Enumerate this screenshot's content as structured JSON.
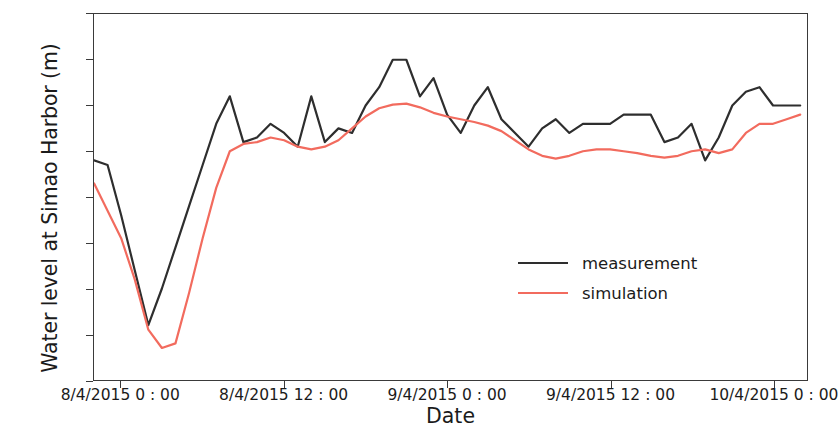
{
  "chart_data": {
    "type": "line",
    "title": "",
    "xlabel": "Date",
    "ylabel": "Water level at Simao Harbor (m)",
    "ylim": [
      594.0,
      598.0
    ],
    "ytick_labels": [
      "594.0",
      "594.5",
      "595.0",
      "595.5",
      "596.0",
      "596.5",
      "597.0",
      "597.5",
      "598.0"
    ],
    "ytick_values": [
      594.0,
      594.5,
      595.0,
      595.5,
      596.0,
      596.5,
      597.0,
      597.5,
      598.0
    ],
    "xtick_labels": [
      "8/4/2015 0 : 00",
      "8/4/2015 12 : 00",
      "9/4/2015 0 : 00",
      "9/4/2015 12 : 00",
      "10/4/2015 0 : 00"
    ],
    "xtick_values": [
      0,
      12,
      24,
      36,
      48
    ],
    "xlim": [
      -2,
      50.5
    ],
    "grid": false,
    "legend_position": "center-right",
    "x": [
      -2,
      -1,
      0,
      1,
      2,
      3,
      4,
      5,
      6,
      7,
      8,
      9,
      10,
      11,
      12,
      13,
      14,
      15,
      16,
      17,
      18,
      19,
      20,
      21,
      22,
      23,
      24,
      25,
      26,
      27,
      28,
      29,
      30,
      31,
      32,
      33,
      34,
      35,
      36,
      37,
      38,
      39,
      40,
      41,
      42,
      43,
      44,
      45,
      46,
      47,
      48,
      49,
      50
    ],
    "series": [
      {
        "name": "measurement",
        "color": "#2e2e2e",
        "values": [
          596.4,
          596.35,
          595.8,
          595.2,
          594.6,
          595.0,
          595.45,
          595.9,
          596.35,
          596.8,
          597.1,
          596.6,
          596.65,
          596.8,
          596.7,
          596.55,
          597.1,
          596.6,
          596.75,
          596.7,
          597.0,
          597.2,
          597.5,
          597.5,
          597.1,
          597.3,
          596.9,
          596.7,
          597.0,
          597.2,
          596.85,
          596.7,
          596.55,
          596.75,
          596.85,
          596.7,
          596.8,
          596.8,
          596.8,
          596.9,
          596.9,
          596.9,
          596.6,
          596.65,
          596.8,
          596.4,
          596.65,
          597.0,
          597.15,
          597.2,
          597.0,
          597.0,
          597.0
        ]
      },
      {
        "name": "simulation",
        "color": "#f26b5e",
        "values": [
          596.15,
          595.85,
          595.55,
          595.1,
          594.55,
          594.35,
          594.4,
          594.95,
          595.55,
          596.1,
          596.5,
          596.58,
          596.6,
          596.65,
          596.62,
          596.55,
          596.52,
          596.55,
          596.62,
          596.75,
          596.88,
          596.97,
          597.01,
          597.02,
          596.98,
          596.92,
          596.88,
          596.85,
          596.82,
          596.78,
          596.72,
          596.62,
          596.52,
          596.45,
          596.42,
          596.45,
          596.5,
          596.52,
          596.52,
          596.5,
          596.48,
          596.45,
          596.43,
          596.45,
          596.5,
          596.52,
          596.48,
          596.52,
          596.7,
          596.8,
          596.8,
          596.85,
          596.9
        ]
      }
    ]
  },
  "legend": {
    "entries": [
      {
        "label": "measurement"
      },
      {
        "label": "simulation"
      }
    ]
  }
}
